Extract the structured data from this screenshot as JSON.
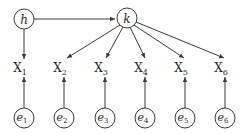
{
  "diagram": {
    "type": "directed-graph",
    "latent_nodes": [
      {
        "id": "h",
        "label": "h"
      },
      {
        "id": "k",
        "label": "k"
      }
    ],
    "observed_nodes": [
      {
        "id": "X1",
        "label": "X",
        "sub": "1"
      },
      {
        "id": "X2",
        "label": "X",
        "sub": "2"
      },
      {
        "id": "X3",
        "label": "X",
        "sub": "3"
      },
      {
        "id": "X4",
        "label": "X",
        "sub": "4"
      },
      {
        "id": "X5",
        "label": "X",
        "sub": "5"
      },
      {
        "id": "X6",
        "label": "X",
        "sub": "6"
      }
    ],
    "error_nodes": [
      {
        "id": "e1",
        "label": "e",
        "sub": "1"
      },
      {
        "id": "e2",
        "label": "e",
        "sub": "2"
      },
      {
        "id": "e3",
        "label": "e",
        "sub": "3"
      },
      {
        "id": "e4",
        "label": "e",
        "sub": "4"
      },
      {
        "id": "e5",
        "label": "e",
        "sub": "5"
      },
      {
        "id": "e6",
        "label": "e",
        "sub": "6"
      }
    ],
    "edges": [
      [
        "h",
        "k"
      ],
      [
        "h",
        "X1"
      ],
      [
        "k",
        "X2"
      ],
      [
        "k",
        "X3"
      ],
      [
        "k",
        "X4"
      ],
      [
        "k",
        "X5"
      ],
      [
        "k",
        "X6"
      ],
      [
        "e1",
        "X1"
      ],
      [
        "e2",
        "X2"
      ],
      [
        "e3",
        "X3"
      ],
      [
        "e4",
        "X4"
      ],
      [
        "e5",
        "X5"
      ],
      [
        "e6",
        "X6"
      ]
    ]
  }
}
